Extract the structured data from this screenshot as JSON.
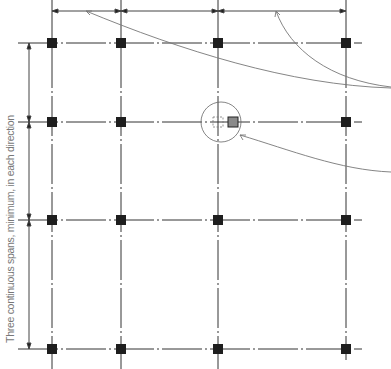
{
  "diagram": {
    "side_label": "Three continuous spans, minimum, in each direction",
    "grid_x": [
      52,
      121,
      218,
      346
    ],
    "grid_y": [
      43,
      122,
      220,
      349
    ],
    "colors": {
      "line": "#333333",
      "column": "#1a1a1a",
      "highlight_column": "#888888",
      "leader": "#777777"
    }
  }
}
